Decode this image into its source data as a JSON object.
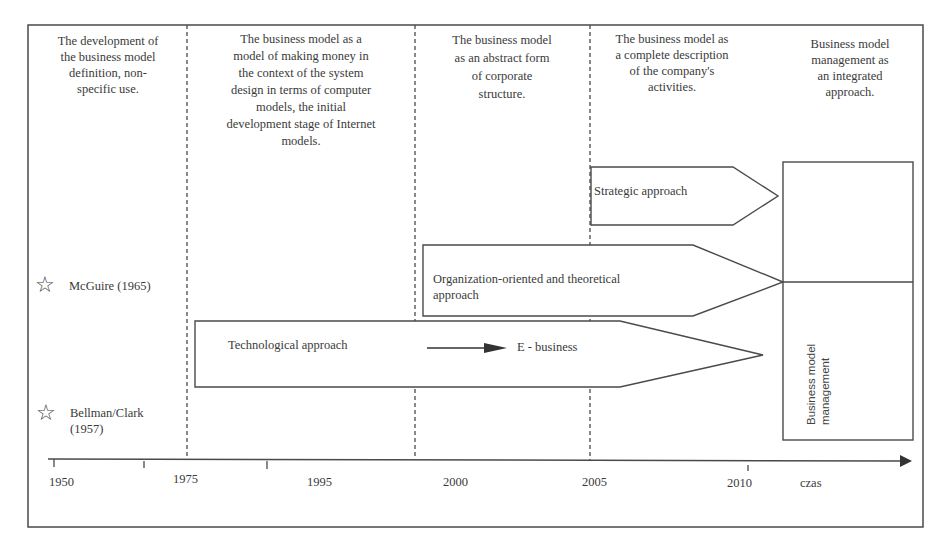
{
  "eras": [
    {
      "id": "era1",
      "text": "The development of the business model definition, non-specific use.",
      "lines": [
        "The development of",
        "the business model",
        "definition, non-",
        "specific use."
      ]
    },
    {
      "id": "era2",
      "text": "The business model as a model of making money in the context of the system design in terms of computer models, the initial development stage of Internet models.",
      "lines": [
        "The business model as a",
        "model of making money in",
        "the context of  the system",
        "design in terms of computer",
        "models, the initial",
        "development stage of Internet",
        "models."
      ]
    },
    {
      "id": "era3",
      "text": "The business model as an abstract form of corporate structure.",
      "lines": [
        "The business model",
        "as an abstract form",
        "of corporate",
        "structure."
      ]
    },
    {
      "id": "era4",
      "text": "The business model as a complete description of the company's activities.",
      "lines": [
        "The business model as",
        "a complete description",
        "of the company's",
        "activities."
      ]
    },
    {
      "id": "era5",
      "text": "Business model management as an integrated approach.",
      "lines": [
        "Business model",
        "management as",
        "an integrated",
        "approach."
      ]
    }
  ],
  "approaches": {
    "strategic": "Strategic approach",
    "organization": [
      "Organization-oriented and theoretical",
      "approach"
    ],
    "technological": "Technological approach",
    "ebusiness": "E - business",
    "management": [
      "Business model",
      "management"
    ]
  },
  "milestones": [
    {
      "label": "McGuire (1965)",
      "icon": "star-outline"
    },
    {
      "label_lines": [
        "Bellman/Clark",
        "(1957)"
      ],
      "icon": "star-outline"
    }
  ],
  "timeline": {
    "ticks": [
      "1950",
      "1975",
      "1995",
      "2000",
      "2005",
      "2010"
    ],
    "axis_label": "czas"
  },
  "colors": {
    "line": "#4a4a4a",
    "text": "#3a3a3a",
    "background": "#ffffff"
  }
}
